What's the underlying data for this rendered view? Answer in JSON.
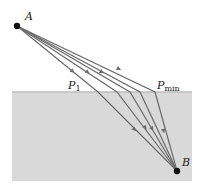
{
  "diagram": {
    "type": "refraction-ray-diagram",
    "colors": {
      "background": "#ffffff",
      "medium": "#d9d9d9",
      "surface_line": "#bdbdbd",
      "ray": "#6b6b6b",
      "point": "#111111"
    },
    "points": {
      "A": {
        "label": "A",
        "x": 17,
        "y": 26
      },
      "B": {
        "label": "B",
        "x": 177,
        "y": 171
      }
    },
    "labels": {
      "A": "A",
      "B": "B",
      "P1_main": "P",
      "P1_sub": "1",
      "Pmin_main": "P",
      "Pmin_sub": "min"
    },
    "surface_y": 92,
    "medium_rect": {
      "x": 12,
      "y": 92,
      "width": 180,
      "height": 89
    },
    "rays": [
      {
        "name": "ray-P1",
        "hit_x": 98
      },
      {
        "name": "ray-2",
        "hit_x": 117
      },
      {
        "name": "ray-3",
        "hit_x": 130
      },
      {
        "name": "ray-4",
        "hit_x": 140
      },
      {
        "name": "ray-Pmin",
        "hit_x": 155
      }
    ]
  }
}
